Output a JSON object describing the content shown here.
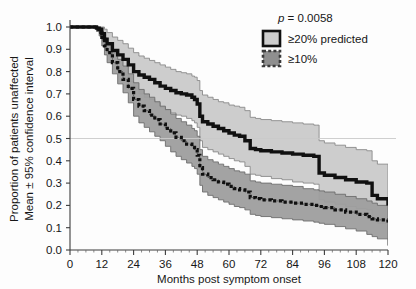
{
  "figure": {
    "background_color": "#fdfdfd",
    "plot_area": {
      "left": 70,
      "right": 388,
      "top": 27,
      "bottom": 250
    }
  },
  "chart_data": {
    "type": "line",
    "title": "",
    "subtitle": "",
    "xlabel": "Months post symptom onset",
    "ylabel": "Proportion of patients unaffected\nMean ± 95% confidence interval",
    "ylabel_line1": "Proportion of patients unaffected",
    "ylabel_line2": "Mean ± 95% confidence interval",
    "xlim": [
      0,
      120
    ],
    "ylim": [
      0.0,
      1.0
    ],
    "xticks": [
      0,
      12,
      24,
      36,
      48,
      60,
      72,
      84,
      96,
      108,
      120
    ],
    "xtick_labels": [
      "0",
      "12",
      "24",
      "36",
      "48",
      "60",
      "72",
      "84",
      "96",
      "108",
      "120"
    ],
    "yticks": [
      0.0,
      0.1,
      0.2,
      0.3,
      0.4,
      0.5,
      0.6,
      0.7,
      0.8,
      0.9,
      1.0
    ],
    "ytick_labels": [
      "0.0",
      "0.1",
      "0.2",
      "0.3",
      "0.4",
      "0.5",
      "0.6",
      "0.7",
      "0.8",
      "0.9",
      "1.0"
    ],
    "grid": false,
    "reference_line": {
      "y": 0.5,
      "color": "#c9c9c9",
      "style": "solid"
    },
    "legend_position": "top-right",
    "annotations": [
      {
        "text": "p = 0.0058",
        "x": 96,
        "y": 0.95
      }
    ],
    "series": [
      {
        "name": "≥20% predicted",
        "style": "solid-thick-black",
        "line_color": "#101010",
        "band_color": "#cdcdcd",
        "band_edge_color": "#8a8a8a",
        "x": [
          0,
          8,
          10,
          11,
          12,
          13,
          14,
          16,
          18,
          20,
          22,
          24,
          26,
          28,
          30,
          32,
          34,
          36,
          38,
          40,
          42,
          44,
          46,
          47,
          48,
          49,
          50,
          52,
          54,
          56,
          58,
          60,
          62,
          64,
          66,
          68,
          70,
          72,
          76,
          80,
          84,
          88,
          92,
          93,
          94,
          96,
          100,
          104,
          108,
          112,
          114,
          116,
          120
        ],
        "y": [
          1.0,
          1.0,
          0.995,
          0.99,
          0.97,
          0.945,
          0.925,
          0.895,
          0.875,
          0.855,
          0.83,
          0.8,
          0.785,
          0.775,
          0.765,
          0.75,
          0.735,
          0.725,
          0.715,
          0.705,
          0.7,
          0.695,
          0.685,
          0.675,
          0.655,
          0.6,
          0.575,
          0.565,
          0.555,
          0.545,
          0.535,
          0.525,
          0.515,
          0.51,
          0.49,
          0.455,
          0.45,
          0.445,
          0.44,
          0.435,
          0.43,
          0.425,
          0.42,
          0.42,
          0.345,
          0.335,
          0.325,
          0.315,
          0.305,
          0.3,
          0.245,
          0.23,
          0.2
        ],
        "upper": [
          1.0,
          1.0,
          1.0,
          1.0,
          1.0,
          0.99,
          0.975,
          0.955,
          0.94,
          0.925,
          0.905,
          0.885,
          0.87,
          0.86,
          0.85,
          0.84,
          0.83,
          0.82,
          0.81,
          0.8,
          0.795,
          0.79,
          0.78,
          0.775,
          0.76,
          0.715,
          0.695,
          0.685,
          0.675,
          0.665,
          0.66,
          0.65,
          0.645,
          0.64,
          0.625,
          0.595,
          0.59,
          0.585,
          0.58,
          0.575,
          0.57,
          0.565,
          0.56,
          0.56,
          0.49,
          0.48,
          0.47,
          0.46,
          0.45,
          0.445,
          0.4,
          0.385,
          0.355
        ],
        "lower": [
          1.0,
          1.0,
          0.985,
          0.975,
          0.945,
          0.905,
          0.875,
          0.835,
          0.81,
          0.785,
          0.755,
          0.72,
          0.7,
          0.685,
          0.675,
          0.66,
          0.64,
          0.625,
          0.615,
          0.605,
          0.6,
          0.59,
          0.58,
          0.57,
          0.55,
          0.49,
          0.46,
          0.45,
          0.44,
          0.43,
          0.42,
          0.41,
          0.4,
          0.395,
          0.375,
          0.34,
          0.335,
          0.33,
          0.32,
          0.315,
          0.305,
          0.3,
          0.295,
          0.295,
          0.225,
          0.215,
          0.205,
          0.195,
          0.185,
          0.18,
          0.135,
          0.12,
          0.09
        ],
        "final_value": 0.2
      },
      {
        "name": "≥10%",
        "style": "dotted-thick-black",
        "line_color": "#101010",
        "band_color": "#9e9e9e",
        "band_edge_color": "#6d6d6d",
        "x": [
          0,
          8,
          10,
          11,
          12,
          13,
          14,
          16,
          18,
          20,
          22,
          24,
          26,
          28,
          30,
          32,
          34,
          36,
          38,
          40,
          42,
          44,
          46,
          47,
          48,
          49,
          50,
          52,
          54,
          56,
          58,
          60,
          62,
          64,
          66,
          68,
          70,
          72,
          76,
          80,
          84,
          88,
          92,
          93,
          94,
          96,
          100,
          104,
          108,
          112,
          114,
          116,
          120
        ],
        "y": [
          1.0,
          1.0,
          0.99,
          0.975,
          0.945,
          0.915,
          0.885,
          0.84,
          0.8,
          0.765,
          0.725,
          0.675,
          0.645,
          0.625,
          0.605,
          0.585,
          0.565,
          0.545,
          0.525,
          0.505,
          0.49,
          0.475,
          0.46,
          0.45,
          0.425,
          0.37,
          0.34,
          0.325,
          0.315,
          0.305,
          0.295,
          0.285,
          0.275,
          0.27,
          0.26,
          0.235,
          0.23,
          0.225,
          0.22,
          0.215,
          0.21,
          0.205,
          0.2,
          0.2,
          0.195,
          0.19,
          0.18,
          0.17,
          0.16,
          0.15,
          0.14,
          0.135,
          0.12
        ],
        "upper": [
          1.0,
          1.0,
          1.0,
          0.995,
          0.975,
          0.95,
          0.925,
          0.885,
          0.855,
          0.825,
          0.79,
          0.75,
          0.72,
          0.7,
          0.685,
          0.665,
          0.645,
          0.63,
          0.61,
          0.59,
          0.575,
          0.56,
          0.545,
          0.535,
          0.51,
          0.45,
          0.42,
          0.405,
          0.395,
          0.385,
          0.375,
          0.365,
          0.355,
          0.35,
          0.34,
          0.31,
          0.305,
          0.3,
          0.295,
          0.29,
          0.285,
          0.275,
          0.27,
          0.27,
          0.265,
          0.26,
          0.25,
          0.24,
          0.23,
          0.22,
          0.21,
          0.2,
          0.185
        ],
        "lower": [
          1.0,
          1.0,
          0.98,
          0.96,
          0.915,
          0.875,
          0.84,
          0.79,
          0.745,
          0.705,
          0.66,
          0.6,
          0.57,
          0.55,
          0.53,
          0.51,
          0.49,
          0.465,
          0.44,
          0.42,
          0.405,
          0.39,
          0.375,
          0.365,
          0.34,
          0.29,
          0.26,
          0.245,
          0.235,
          0.225,
          0.215,
          0.205,
          0.195,
          0.19,
          0.18,
          0.16,
          0.155,
          0.15,
          0.145,
          0.14,
          0.135,
          0.13,
          0.125,
          0.125,
          0.12,
          0.115,
          0.105,
          0.095,
          0.085,
          0.07,
          0.06,
          0.05,
          0.02
        ],
        "final_value": 0.12
      }
    ]
  },
  "legend": {
    "pvalue_symbol": "p",
    "pvalue_text": " = 0.0058",
    "items": [
      {
        "label": "≥20% predicted",
        "swatch_fill": "#cdcdcd",
        "swatch_border": "#101010",
        "swatch_style": "solid"
      },
      {
        "label": "≥10%",
        "swatch_fill": "#8f8f8f",
        "swatch_border": "#3a3a3a",
        "swatch_style": "dashed"
      }
    ]
  }
}
